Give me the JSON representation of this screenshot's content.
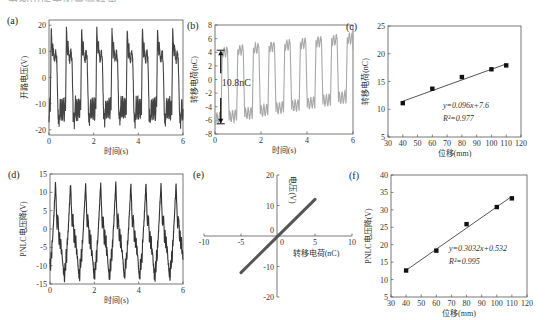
{
  "caption_fragment": "为图中所示的量测结果",
  "chart_data": [
    {
      "panel": "(a)",
      "type": "line",
      "title": "",
      "xlabel": "时间(s)",
      "ylabel": "开路电压(V)",
      "xlim": [
        0,
        6
      ],
      "ylim": [
        -22,
        22
      ],
      "xticks": [
        0,
        2,
        4,
        6
      ],
      "yticks": [
        -20,
        -10,
        0,
        10,
        20
      ],
      "series": [
        {
          "name": "open-circuit voltage",
          "color": "#444444",
          "period_s": 0.68,
          "high": 19,
          "mid_high": 8,
          "low": -12,
          "min": -18,
          "waveform": "square-like with ripples"
        }
      ],
      "grid": false
    },
    {
      "panel": "(b)",
      "type": "line",
      "xlabel": "时间(s)",
      "ylabel": "转移电荷(nC)",
      "xlim": [
        0,
        6
      ],
      "ylim": [
        -8,
        8
      ],
      "xticks": [
        0,
        2,
        4,
        6
      ],
      "yticks": [
        -8,
        -6,
        -4,
        -2,
        0,
        2,
        4,
        6,
        8
      ],
      "series": [
        {
          "name": "transferred charge",
          "color": "#a8a8a8",
          "period_s": 0.68,
          "high_start": 4.3,
          "high_end": 6.5,
          "low_start": -6.4,
          "low_end": -3.0
        }
      ],
      "annotation": {
        "text": "10.8nC",
        "from": 4.3,
        "to": -6.5,
        "x": 0.25
      },
      "grid": false
    },
    {
      "panel": "(c)",
      "type": "scatter",
      "xlabel": "位移(mm)",
      "ylabel": "转移电荷(nC)",
      "xlim": [
        30,
        120
      ],
      "ylim": [
        5,
        25
      ],
      "xticks": [
        30,
        40,
        50,
        60,
        70,
        80,
        90,
        100,
        110,
        120
      ],
      "yticks": [
        5,
        10,
        15,
        20,
        25
      ],
      "x": [
        40,
        60,
        80,
        100,
        110
      ],
      "values": [
        11.1,
        13.7,
        15.8,
        17.2,
        17.9
      ],
      "fit": {
        "slope": 0.096,
        "intercept": 7.6,
        "x_range": [
          40,
          110
        ]
      },
      "annotations": [
        "y=0.096x+7.6",
        "R²=0.977"
      ],
      "grid": false
    },
    {
      "panel": "(d)",
      "type": "line",
      "xlabel": "时间(s)",
      "ylabel": "PNLC电压降(V)",
      "xlim": [
        0,
        6
      ],
      "ylim": [
        -15,
        15
      ],
      "xticks": [
        0,
        2,
        4,
        6
      ],
      "yticks": [
        -15,
        -10,
        -5,
        0,
        5,
        10,
        15
      ],
      "series": [
        {
          "name": "PNLC voltage drop",
          "color": "#333333",
          "period_s": 0.68,
          "max": 12.5,
          "min": -13.5
        }
      ],
      "grid": false
    },
    {
      "panel": "(e)",
      "type": "line",
      "xlabel": "转移电荷(nC)",
      "ylabel": "电压(V)",
      "xlim": [
        -10,
        10
      ],
      "ylim": [
        -20,
        20
      ],
      "xticks": [
        -10,
        -5,
        0,
        5,
        10
      ],
      "yticks": [
        -20,
        -10,
        0,
        10,
        20
      ],
      "x": [
        -5,
        5
      ],
      "values": [
        -12,
        12
      ],
      "series": [
        {
          "name": "V vs Q",
          "color": "#555555",
          "x": [
            -5,
            5
          ],
          "values": [
            -12,
            12
          ]
        }
      ],
      "grid": false
    },
    {
      "panel": "(f)",
      "type": "scatter",
      "xlabel": "位移(mm)",
      "ylabel": "PNLC电压降(V)",
      "xlim": [
        30,
        120
      ],
      "ylim": [
        5,
        40
      ],
      "xticks": [
        30,
        40,
        50,
        60,
        70,
        80,
        90,
        100,
        110,
        120
      ],
      "yticks": [
        5,
        10,
        15,
        20,
        25,
        30,
        35,
        40
      ],
      "x": [
        40,
        60,
        80,
        100,
        110
      ],
      "values": [
        12.6,
        18.3,
        25.9,
        30.8,
        33.3
      ],
      "fit": {
        "slope": 0.3032,
        "intercept": 0.532,
        "x_range": [
          40,
          110
        ]
      },
      "annotations": [
        "y=0.3032x+0.532",
        "R²=0.995"
      ],
      "grid": false
    }
  ]
}
